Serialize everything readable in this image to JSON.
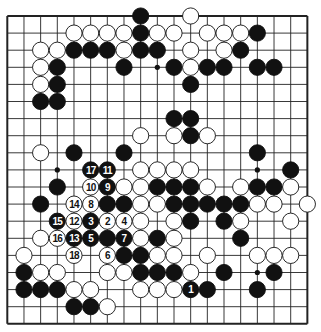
{
  "board": {
    "size": 19,
    "origin_x": 7.3,
    "origin_y": 16,
    "spacing_x": 16.67,
    "spacing_y": 17.1,
    "stone_radius": 8.1,
    "hoshi": [
      [
        3,
        9
      ],
      [
        9,
        3
      ],
      [
        15,
        9
      ],
      [
        15,
        15
      ]
    ],
    "colors": {
      "line": "#222222",
      "black": "#111111",
      "white": "#ffffff",
      "number_on_black": "#ffffff",
      "number_on_white": "#111111"
    }
  },
  "stones": [
    {
      "c": 8,
      "r": 0,
      "color": "B"
    },
    {
      "c": 11,
      "r": 0,
      "color": "W"
    },
    {
      "c": 4,
      "r": 1,
      "color": "W"
    },
    {
      "c": 5,
      "r": 1,
      "color": "W"
    },
    {
      "c": 6,
      "r": 1,
      "color": "W"
    },
    {
      "c": 7,
      "r": 1,
      "color": "W"
    },
    {
      "c": 8,
      "r": 1,
      "color": "B"
    },
    {
      "c": 9,
      "r": 1,
      "color": "W"
    },
    {
      "c": 10,
      "r": 1,
      "color": "W"
    },
    {
      "c": 12,
      "r": 1,
      "color": "W"
    },
    {
      "c": 13,
      "r": 1,
      "color": "W"
    },
    {
      "c": 14,
      "r": 1,
      "color": "W"
    },
    {
      "c": 15,
      "r": 1,
      "color": "B"
    },
    {
      "c": 2,
      "r": 2,
      "color": "W"
    },
    {
      "c": 3,
      "r": 2,
      "color": "W"
    },
    {
      "c": 4,
      "r": 2,
      "color": "B"
    },
    {
      "c": 5,
      "r": 2,
      "color": "B"
    },
    {
      "c": 6,
      "r": 2,
      "color": "B"
    },
    {
      "c": 7,
      "r": 2,
      "color": "W"
    },
    {
      "c": 8,
      "r": 2,
      "color": "B"
    },
    {
      "c": 9,
      "r": 2,
      "color": "B"
    },
    {
      "c": 11,
      "r": 2,
      "color": "W"
    },
    {
      "c": 13,
      "r": 2,
      "color": "W"
    },
    {
      "c": 14,
      "r": 2,
      "color": "B"
    },
    {
      "c": 2,
      "r": 3,
      "color": "W"
    },
    {
      "c": 3,
      "r": 3,
      "color": "B"
    },
    {
      "c": 7,
      "r": 3,
      "color": "B"
    },
    {
      "c": 10,
      "r": 3,
      "color": "B"
    },
    {
      "c": 11,
      "r": 3,
      "color": "W"
    },
    {
      "c": 12,
      "r": 3,
      "color": "B"
    },
    {
      "c": 13,
      "r": 3,
      "color": "B"
    },
    {
      "c": 15,
      "r": 3,
      "color": "B"
    },
    {
      "c": 16,
      "r": 3,
      "color": "B"
    },
    {
      "c": 2,
      "r": 4,
      "color": "W"
    },
    {
      "c": 3,
      "r": 4,
      "color": "B"
    },
    {
      "c": 11,
      "r": 4,
      "color": "B"
    },
    {
      "c": 2,
      "r": 5,
      "color": "B"
    },
    {
      "c": 3,
      "r": 5,
      "color": "B"
    },
    {
      "c": 10,
      "r": 6,
      "color": "B"
    },
    {
      "c": 11,
      "r": 6,
      "color": "B"
    },
    {
      "c": 8,
      "r": 7,
      "color": "W"
    },
    {
      "c": 10,
      "r": 7,
      "color": "W"
    },
    {
      "c": 11,
      "r": 7,
      "color": "B"
    },
    {
      "c": 12,
      "r": 7,
      "color": "W"
    },
    {
      "c": 2,
      "r": 8,
      "color": "W"
    },
    {
      "c": 4,
      "r": 8,
      "color": "B"
    },
    {
      "c": 7,
      "r": 8,
      "color": "B"
    },
    {
      "c": 15,
      "r": 8,
      "color": "B"
    },
    {
      "c": 5,
      "r": 9,
      "color": "B",
      "n": "17"
    },
    {
      "c": 6,
      "r": 9,
      "color": "B",
      "n": "11"
    },
    {
      "c": 8,
      "r": 9,
      "color": "W"
    },
    {
      "c": 9,
      "r": 9,
      "color": "W"
    },
    {
      "c": 10,
      "r": 9,
      "color": "W"
    },
    {
      "c": 11,
      "r": 9,
      "color": "W"
    },
    {
      "c": 17,
      "r": 9,
      "color": "B"
    },
    {
      "c": 3,
      "r": 10,
      "color": "B"
    },
    {
      "c": 5,
      "r": 10,
      "color": "W",
      "n": "10"
    },
    {
      "c": 6,
      "r": 10,
      "color": "B",
      "n": "9"
    },
    {
      "c": 7,
      "r": 10,
      "color": "W"
    },
    {
      "c": 8,
      "r": 10,
      "color": "W"
    },
    {
      "c": 9,
      "r": 10,
      "color": "B"
    },
    {
      "c": 10,
      "r": 10,
      "color": "B"
    },
    {
      "c": 11,
      "r": 10,
      "color": "B"
    },
    {
      "c": 12,
      "r": 10,
      "color": "W"
    },
    {
      "c": 14,
      "r": 10,
      "color": "W"
    },
    {
      "c": 15,
      "r": 10,
      "color": "B"
    },
    {
      "c": 16,
      "r": 10,
      "color": "B"
    },
    {
      "c": 17,
      "r": 10,
      "color": "W"
    },
    {
      "c": 2,
      "r": 11,
      "color": "B"
    },
    {
      "c": 4,
      "r": 11,
      "color": "W",
      "n": "14"
    },
    {
      "c": 5,
      "r": 11,
      "color": "W",
      "n": "8"
    },
    {
      "c": 6,
      "r": 11,
      "color": "B"
    },
    {
      "c": 7,
      "r": 11,
      "color": "B"
    },
    {
      "c": 8,
      "r": 11,
      "color": "W"
    },
    {
      "c": 9,
      "r": 11,
      "color": "W"
    },
    {
      "c": 10,
      "r": 11,
      "color": "B"
    },
    {
      "c": 11,
      "r": 11,
      "color": "B"
    },
    {
      "c": 12,
      "r": 11,
      "color": "B"
    },
    {
      "c": 13,
      "r": 11,
      "color": "B"
    },
    {
      "c": 14,
      "r": 11,
      "color": "B"
    },
    {
      "c": 15,
      "r": 11,
      "color": "W"
    },
    {
      "c": 16,
      "r": 11,
      "color": "W"
    },
    {
      "c": 18,
      "r": 11,
      "color": "W"
    },
    {
      "c": 3,
      "r": 12,
      "color": "B",
      "n": "15"
    },
    {
      "c": 4,
      "r": 12,
      "color": "W",
      "n": "12"
    },
    {
      "c": 5,
      "r": 12,
      "color": "B",
      "n": "3"
    },
    {
      "c": 6,
      "r": 12,
      "color": "W",
      "n": "2"
    },
    {
      "c": 7,
      "r": 12,
      "color": "W",
      "n": "4"
    },
    {
      "c": 8,
      "r": 12,
      "color": "W"
    },
    {
      "c": 10,
      "r": 12,
      "color": "W"
    },
    {
      "c": 11,
      "r": 12,
      "color": "B"
    },
    {
      "c": 13,
      "r": 12,
      "color": "B"
    },
    {
      "c": 14,
      "r": 12,
      "color": "W"
    },
    {
      "c": 17,
      "r": 12,
      "color": "W"
    },
    {
      "c": 2,
      "r": 13,
      "color": "W"
    },
    {
      "c": 3,
      "r": 13,
      "color": "W",
      "n": "16"
    },
    {
      "c": 4,
      "r": 13,
      "color": "B",
      "n": "13"
    },
    {
      "c": 5,
      "r": 13,
      "color": "B",
      "n": "5"
    },
    {
      "c": 6,
      "r": 13,
      "color": "B"
    },
    {
      "c": 7,
      "r": 13,
      "color": "B",
      "n": "7"
    },
    {
      "c": 8,
      "r": 13,
      "color": "W"
    },
    {
      "c": 9,
      "r": 13,
      "color": "B"
    },
    {
      "c": 10,
      "r": 13,
      "color": "W"
    },
    {
      "c": 14,
      "r": 13,
      "color": "B"
    },
    {
      "c": 1,
      "r": 14,
      "color": "W"
    },
    {
      "c": 4,
      "r": 14,
      "color": "W",
      "n": "18"
    },
    {
      "c": 6,
      "r": 14,
      "color": "W",
      "n": "6"
    },
    {
      "c": 7,
      "r": 14,
      "color": "B"
    },
    {
      "c": 8,
      "r": 14,
      "color": "B"
    },
    {
      "c": 9,
      "r": 14,
      "color": "W"
    },
    {
      "c": 10,
      "r": 14,
      "color": "W"
    },
    {
      "c": 12,
      "r": 14,
      "color": "W"
    },
    {
      "c": 15,
      "r": 14,
      "color": "W"
    },
    {
      "c": 16,
      "r": 14,
      "color": "W"
    },
    {
      "c": 17,
      "r": 14,
      "color": "W"
    },
    {
      "c": 1,
      "r": 15,
      "color": "B"
    },
    {
      "c": 2,
      "r": 15,
      "color": "W"
    },
    {
      "c": 3,
      "r": 15,
      "color": "W"
    },
    {
      "c": 6,
      "r": 15,
      "color": "W"
    },
    {
      "c": 7,
      "r": 15,
      "color": "W"
    },
    {
      "c": 8,
      "r": 15,
      "color": "B"
    },
    {
      "c": 9,
      "r": 15,
      "color": "B"
    },
    {
      "c": 10,
      "r": 15,
      "color": "B"
    },
    {
      "c": 11,
      "r": 15,
      "color": "W"
    },
    {
      "c": 13,
      "r": 15,
      "color": "B"
    },
    {
      "c": 16,
      "r": 15,
      "color": "B"
    },
    {
      "c": 1,
      "r": 16,
      "color": "B"
    },
    {
      "c": 2,
      "r": 16,
      "color": "B"
    },
    {
      "c": 3,
      "r": 16,
      "color": "B"
    },
    {
      "c": 4,
      "r": 16,
      "color": "W"
    },
    {
      "c": 5,
      "r": 16,
      "color": "W"
    },
    {
      "c": 8,
      "r": 16,
      "color": "W"
    },
    {
      "c": 9,
      "r": 16,
      "color": "W"
    },
    {
      "c": 10,
      "r": 16,
      "color": "W"
    },
    {
      "c": 11,
      "r": 16,
      "color": "B",
      "n": "1"
    },
    {
      "c": 12,
      "r": 16,
      "color": "B"
    },
    {
      "c": 15,
      "r": 16,
      "color": "B"
    },
    {
      "c": 4,
      "r": 17,
      "color": "B"
    },
    {
      "c": 5,
      "r": 17,
      "color": "B"
    },
    {
      "c": 6,
      "r": 17,
      "color": "W"
    }
  ]
}
